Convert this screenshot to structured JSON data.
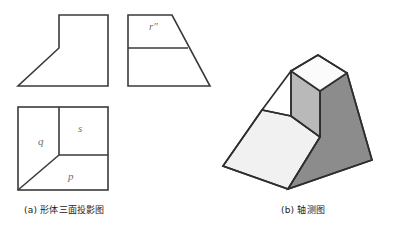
{
  "figure": {
    "background_color": "#ffffff",
    "line_color": "#3a3a3a",
    "label_color": "#6f6f6f",
    "captions": [
      {
        "key": "a",
        "text": "(a) 形体三面投影图"
      },
      {
        "key": "b",
        "text": "(b) 轴测图"
      }
    ],
    "orthographic": {
      "title": "(a) 形体三面投影图",
      "views": [
        {
          "name": "front-view",
          "description": "front elevation: rectangle with chamfered lower-left corner",
          "outline_points": "59,15 108,15 108,86 18,86 59,48",
          "fill": "#ffffff"
        },
        {
          "name": "side-view",
          "description": "left side elevation: trapezoid with horizontal division",
          "outline_points": "128,15 172,15 210,86 128,86",
          "divider_line": "128,48 188,48",
          "fill": "#ffffff",
          "labels": [
            {
              "name": "plane-r",
              "text": "r″"
            }
          ]
        },
        {
          "name": "top-view",
          "description": "plan: square divided into planes q, s and p",
          "outline_points": "18,107 108,107 108,190 18,190",
          "inner_lines": [
            "59,107 59,155",
            "59,155 108,155",
            "18,190 59,155"
          ],
          "fill": "#ffffff",
          "labels": [
            {
              "name": "plane-q",
              "text": "q"
            },
            {
              "name": "plane-s",
              "text": "s"
            },
            {
              "name": "plane-p",
              "text": "p"
            }
          ]
        }
      ]
    },
    "axonometric": {
      "title": "(b) 轴测图",
      "description": "isometric pictorial of a truncated pyramid base carrying a smaller prism on top",
      "faces": [
        {
          "name": "top-face",
          "points": "291,71 318,55 347,73 320,91",
          "fill": "#fafafa"
        },
        {
          "name": "upper-left-face",
          "points": "291,71 320,91 320,137 291,116",
          "fill": "#b9b9b9"
        },
        {
          "name": "right-face",
          "points": "320,91 347,73 372,160 371,181 288,189 320,137",
          "fill": "#8c8c8c"
        },
        {
          "name": "front-left-face",
          "points": "262,110 291,116 320,137 288,189 262,181",
          "fill": "#f2f2f2"
        },
        {
          "name": "left-slope-face",
          "points": "262,110 291,116 291,116 262,181 260,181",
          "fill": "#ededed"
        },
        {
          "name": "base-left-face",
          "points": "262,110 262,181 288,189 223,166 230,150",
          "fill": "#efefef"
        }
      ],
      "outline_points": "318,55 347,73 372,160 288,189 223,166 262,110 291,71",
      "edges": [
        "291,71 318,55",
        "318,55 347,73",
        "347,73 372,160",
        "372,160 288,189",
        "288,189 223,166",
        "223,166 262,110",
        "262,110 291,71",
        "291,71 320,91",
        "320,91 347,73",
        "320,91 320,137",
        "291,71 291,116",
        "291,116 262,110",
        "320,137 288,189",
        "291,116 320,137",
        "262,110 262,181",
        "262,181 288,189"
      ]
    }
  }
}
